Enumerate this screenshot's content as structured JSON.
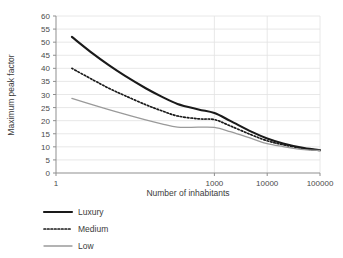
{
  "chart_data": {
    "type": "line",
    "title": "",
    "subtitle": "",
    "xlabel": "Number of inhabitants",
    "ylabel": "Maximum peak factor",
    "xscale": "log",
    "yscale": "linear",
    "xlim": [
      1,
      100000
    ],
    "ylim": [
      0,
      60
    ],
    "grid": "horizontal-and-vertical-major",
    "legend_position": "below-left",
    "x_tick_labels": [
      "1",
      "1000",
      "10000",
      "100000"
    ],
    "x_tick_values": [
      1,
      1000,
      10000,
      100000
    ],
    "y_tick_labels": [
      "0",
      "5",
      "10",
      "15",
      "20",
      "25",
      "30",
      "35",
      "40",
      "45",
      "50",
      "55",
      "60"
    ],
    "y_tick_values": [
      0,
      5,
      10,
      15,
      20,
      25,
      30,
      35,
      40,
      45,
      50,
      55,
      60
    ],
    "x": [
      2,
      5,
      10,
      20,
      50,
      100,
      200,
      500,
      1000,
      2000,
      5000,
      10000,
      20000,
      50000,
      100000
    ],
    "series": [
      {
        "name": "Luxury",
        "color": "#1a1a1a",
        "style": "solid",
        "width": 2.1,
        "values": [
          52.0,
          45.6,
          41.2,
          37.2,
          32.4,
          29.2,
          26.4,
          24.3,
          22.9,
          19.9,
          15.8,
          13.2,
          11.3,
          9.5,
          8.7
        ]
      },
      {
        "name": "Medium",
        "color": "#1a1a1a",
        "style": "dotted",
        "width": 1.7,
        "values": [
          40.0,
          35.6,
          32.4,
          29.6,
          26.1,
          23.8,
          21.8,
          20.7,
          20.4,
          18.0,
          14.6,
          12.3,
          10.8,
          9.3,
          8.7
        ]
      },
      {
        "name": "Low",
        "color": "#9a9a9a",
        "style": "solid",
        "width": 1.3,
        "values": [
          28.5,
          26.0,
          24.2,
          22.5,
          20.3,
          18.8,
          17.5,
          17.5,
          17.4,
          15.8,
          13.2,
          11.2,
          10.1,
          8.9,
          8.6
        ]
      }
    ],
    "legend": [
      {
        "label": "Luxury",
        "color": "#1a1a1a",
        "style": "solid"
      },
      {
        "label": "Medium",
        "color": "#1a1a1a",
        "style": "dotted"
      },
      {
        "label": "Low",
        "color": "#9a9a9a",
        "style": "solid"
      }
    ],
    "colors": {
      "background": "#ffffff",
      "gridline": "#e2e2e2",
      "axis": "#8f8f8f",
      "text": "#3b3b3b",
      "luxury": "#1a1a1a",
      "medium": "#1a1a1a",
      "low": "#9a9a9a"
    }
  }
}
